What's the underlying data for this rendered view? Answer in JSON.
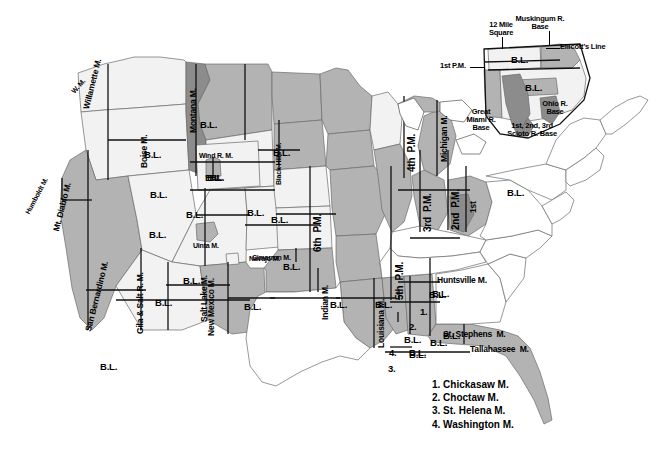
{
  "map": {
    "title": "Principal Meridians and Base Lines of the United States Public Land Survey System",
    "caption": "",
    "colors": {
      "background": "#ffffff",
      "land_light": "#f2f2f2",
      "land_medium": "#b3b3b3",
      "land_dark": "#8c8c8c",
      "land_white": "#ffffff",
      "outline": "#555555",
      "border_heavy": "#111111",
      "text": "#000000"
    }
  },
  "meridian_labels": [
    {
      "id": "willamette",
      "text": "Willamette M."
    },
    {
      "id": "willamette-wm",
      "text": "W. M."
    },
    {
      "id": "humboldt",
      "text": "Humboldt M."
    },
    {
      "id": "mt-diablo",
      "text": "Mt. Diablo M."
    },
    {
      "id": "san-bernardino",
      "text": "San Bernardino M."
    },
    {
      "id": "gila-salt",
      "text": "Gila & Salt R. M."
    },
    {
      "id": "navajo",
      "text": "Navajo M."
    },
    {
      "id": "salt-lake",
      "text": "Salt Lake M."
    },
    {
      "id": "uinta",
      "text": "Uinta M."
    },
    {
      "id": "boise",
      "text": "Boise M."
    },
    {
      "id": "montana",
      "text": "Montana M."
    },
    {
      "id": "wind-river",
      "text": "Wind R. M."
    },
    {
      "id": "black-hills",
      "text": "Black Hills M."
    },
    {
      "id": "new-mexico",
      "text": "New Mexico M."
    },
    {
      "id": "cimarron",
      "text": "Cimarron M."
    },
    {
      "id": "sixth-pm",
      "text": "6th  P.M."
    },
    {
      "id": "fifth-pm",
      "text": "5th  P.M."
    },
    {
      "id": "fourth-pm",
      "text": "4th  P.M."
    },
    {
      "id": "third-pm",
      "text": "3rd  P.M."
    },
    {
      "id": "second-pm",
      "text": "2nd  P.M."
    },
    {
      "id": "first-pm-in",
      "text": "1st"
    },
    {
      "id": "michigan",
      "text": "Michigan M."
    },
    {
      "id": "indian",
      "text": "Indian M."
    },
    {
      "id": "louisiana",
      "text": "Louisiana M."
    },
    {
      "id": "huntsville",
      "text": "Huntsville M."
    },
    {
      "id": "st-stephens",
      "text": "St. Stephens  M."
    },
    {
      "id": "tallahassee",
      "text": "Tallahassee  M."
    }
  ],
  "baselines": {
    "label": "B.L.",
    "count": 21
  },
  "ohio_inset": {
    "callouts": [
      {
        "id": "twelve-mile-square",
        "text": "12 Mile\nSquare"
      },
      {
        "id": "muskingum-base",
        "text": "Muskingum R.\nBase"
      },
      {
        "id": "ellicotts-line",
        "text": "Ellicott's Line"
      },
      {
        "id": "first-pm",
        "text": "1st P.M."
      },
      {
        "id": "great-miami-base",
        "text": "Great\nMiami R.\nBase"
      },
      {
        "id": "scioto-base",
        "text": "1st, 2nd, 3rd\nScioto R. Base"
      },
      {
        "id": "ohio-river-base",
        "text": "Ohio R.\nBase"
      }
    ]
  },
  "numbered_legend": {
    "items": [
      {
        "number": "1.",
        "label": "1. Chickasaw M."
      },
      {
        "number": "2.",
        "label": "2. Choctaw M."
      },
      {
        "number": "3.",
        "label": "3. St. Helena M."
      },
      {
        "number": "4.",
        "label": "4. Washington M."
      }
    ],
    "markers": [
      "1.",
      "2.",
      "3.",
      "4."
    ]
  }
}
